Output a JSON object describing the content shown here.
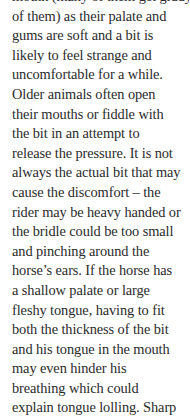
{
  "document": {
    "paragraph_lines": [
      "mouth (many of them get giddy",
      "of them) as their palate and",
      "gums are soft and a bit is",
      "likely to feel strange and",
      "uncomfortable for a while.",
      "Older animals often open",
      "their mouths or fiddle with",
      "the bit in an attempt to",
      "release the pressure. It is not",
      "always the actual bit that may",
      "cause the discomfort – the",
      "rider may be heavy handed or",
      "the bridle could be too small",
      "and pinching around the",
      "horse’s ears. If the horse has",
      "a shallow palate or large",
      "fleshy tongue, having to fit",
      "both the thickness of the bit",
      "and his tongue in the mouth",
      "may even hinder his",
      "breathing which could",
      "explain tongue lolling. Sharp"
    ]
  }
}
